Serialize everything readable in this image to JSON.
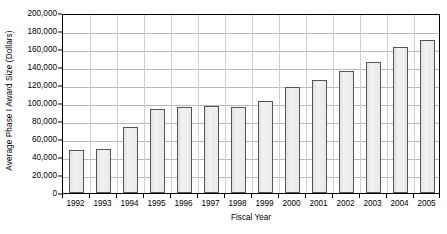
{
  "chart_data": {
    "type": "bar",
    "title": "",
    "xlabel": "Fiscal Year",
    "ylabel": "Average Phase I Award Size (Dollars)",
    "categories": [
      "1992",
      "1993",
      "1994",
      "1995",
      "1996",
      "1997",
      "1998",
      "1999",
      "2000",
      "2001",
      "2002",
      "2003",
      "2004",
      "2005"
    ],
    "values": [
      48000,
      49000,
      73000,
      93000,
      95500,
      96500,
      96000,
      102000,
      118000,
      126000,
      136000,
      146000,
      162000,
      170000
    ],
    "ylim": [
      0,
      200000
    ],
    "ytick_values": [
      0,
      20000,
      40000,
      60000,
      80000,
      100000,
      120000,
      140000,
      160000,
      180000,
      200000
    ],
    "ytick_labels": [
      "0",
      "20,000",
      "40,000",
      "60,000",
      "80,000",
      "100,000",
      "120,000",
      "140,000",
      "160,000",
      "180,000",
      "200,000"
    ],
    "grid": "horizontal-and-vertical",
    "legend": "none",
    "bar_fill_color": "#ededed",
    "bar_border_color": "#555555",
    "gridline_color": "#b9b9b9",
    "axis_color": "#000000"
  }
}
